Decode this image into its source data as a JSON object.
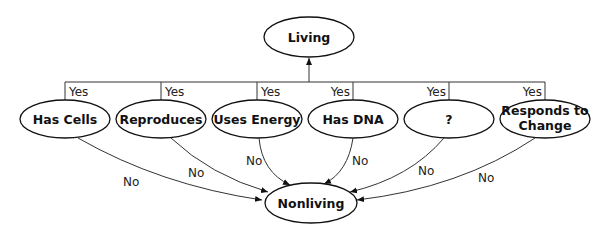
{
  "diagram": {
    "top_node": {
      "label": "Living"
    },
    "bottom_node": {
      "label": "Nonliving"
    },
    "criteria": [
      {
        "label": "Has Cells",
        "yes": "Yes",
        "no": "No"
      },
      {
        "label": "Reproduces",
        "yes": "Yes",
        "no": "No"
      },
      {
        "label": "Uses Energy",
        "yes": "Yes",
        "no": "No"
      },
      {
        "label": "Has DNA",
        "yes": "Yes",
        "no": "No"
      },
      {
        "label": "?",
        "yes": "Yes",
        "no": "No"
      },
      {
        "label_line1": "Responds to",
        "label_line2": "Change",
        "yes": "Yes",
        "no": "No"
      }
    ]
  }
}
